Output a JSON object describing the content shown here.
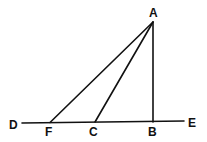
{
  "diagram": {
    "type": "geometry",
    "colors": {
      "line": "#111111",
      "background": "#ffffff"
    },
    "points": {
      "A": {
        "label": "A",
        "x": 153,
        "y": 22
      },
      "B": {
        "label": "B",
        "x": 153,
        "y": 122
      },
      "C": {
        "label": "C",
        "x": 95,
        "y": 122
      },
      "F": {
        "label": "F",
        "x": 50,
        "y": 122
      },
      "D": {
        "label": "D",
        "x": 22,
        "y": 123
      },
      "E": {
        "label": "E",
        "x": 184,
        "y": 121
      }
    },
    "segments": [
      {
        "from": "D",
        "to": "E"
      },
      {
        "from": "A",
        "to": "F"
      },
      {
        "from": "A",
        "to": "C"
      },
      {
        "from": "A",
        "to": "B"
      }
    ],
    "labels": {
      "A": "A",
      "B": "B",
      "C": "C",
      "D": "D",
      "E": "E",
      "F": "F"
    }
  }
}
